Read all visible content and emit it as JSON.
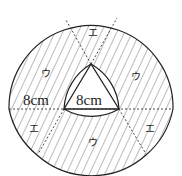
{
  "diagram": {
    "labels": {
      "left_radius": "8cm",
      "triangle_side": "8cm",
      "region_u": "ウ",
      "region_e": "エ"
    },
    "colors": {
      "stroke": "#222222",
      "hatch": "#555555",
      "background": "#ffffff"
    }
  }
}
